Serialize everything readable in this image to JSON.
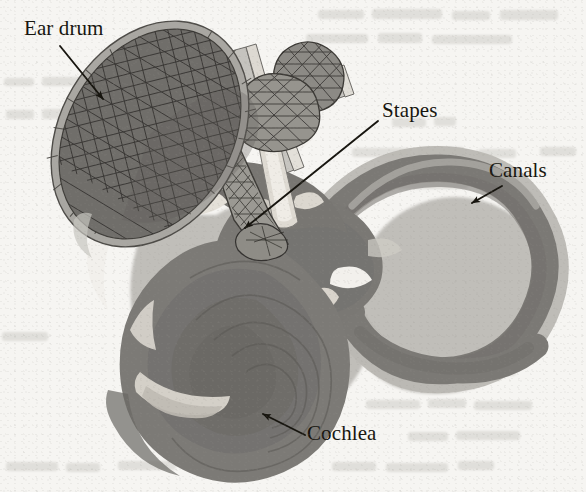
{
  "figure": {
    "kind": "anatomical-diagram",
    "rendering": "grayscale scanned book figure",
    "background_color": "#f6f5f2",
    "ink_color": "#17150f",
    "palette": {
      "paper": "#f6f5f2",
      "halo": "#b9b7b2",
      "body_mid": "#7c7a76",
      "body_dark": "#6a6864",
      "body_darker": "#5d5b57",
      "bone_light": "#c9c7c2",
      "bone_highlight": "#e8e6e1",
      "mesh_line": "#3a3834",
      "drum_fill": "#6f6d69",
      "drum_rim": "#a9a7a2"
    },
    "labels": [
      {
        "id": "ear-drum",
        "text": "Ear drum",
        "x": 24,
        "y": 18,
        "arrow": {
          "x1": 60,
          "y1": 46,
          "x2": 103,
          "y2": 99
        }
      },
      {
        "id": "stapes",
        "text": "Stapes",
        "x": 382,
        "y": 100,
        "arrow": {
          "x1": 378,
          "y1": 121,
          "x2": 245,
          "y2": 228
        }
      },
      {
        "id": "canals",
        "text": "Canals",
        "x": 489,
        "y": 160,
        "arrow": {
          "x1": 502,
          "y1": 186,
          "x2": 472,
          "y2": 203
        }
      },
      {
        "id": "cochlea",
        "text": "Cochlea",
        "x": 307,
        "y": 423,
        "arrow": {
          "x1": 305,
          "y1": 435,
          "x2": 263,
          "y2": 414
        }
      }
    ],
    "parts": [
      {
        "id": "ear-drum",
        "name": "Ear drum (tympanic membrane)",
        "style": "triangulated mesh ellipse, tilted"
      },
      {
        "id": "ossicles",
        "name": "Ossicles (malleus and incus)",
        "style": "triangulated mesh blobs"
      },
      {
        "id": "stapes",
        "name": "Stapes",
        "style": "fine triangulated strut"
      },
      {
        "id": "cochlea",
        "name": "Cochlea",
        "style": "spiral coil, lower left"
      },
      {
        "id": "canals",
        "name": "Semicircular canals",
        "style": "looped tori, right"
      }
    ]
  }
}
